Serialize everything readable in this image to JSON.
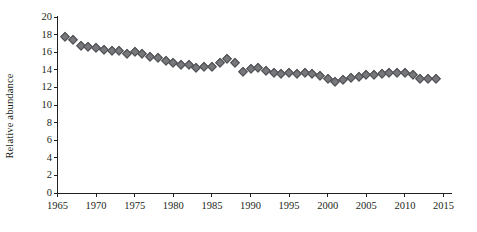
{
  "chart_data": {
    "type": "scatter",
    "title": "",
    "xlabel": "",
    "ylabel": "Relative abundance",
    "xlim": [
      1964,
      2016
    ],
    "ylim": [
      0,
      20
    ],
    "grid": false,
    "legend": null,
    "marker_shape": "diamond",
    "marker_color": "#77787b",
    "marker_edge_color": "#4d4e52",
    "x_ticks": [
      1965,
      1970,
      1975,
      1980,
      1985,
      1990,
      1995,
      2000,
      2005,
      2010,
      2015
    ],
    "y_ticks": [
      0,
      2,
      4,
      6,
      8,
      10,
      12,
      14,
      16,
      18,
      20
    ],
    "x": [
      1966,
      1967,
      1968,
      1969,
      1970,
      1971,
      1972,
      1973,
      1974,
      1975,
      1976,
      1977,
      1978,
      1979,
      1980,
      1981,
      1982,
      1983,
      1984,
      1985,
      1986,
      1987,
      1988,
      1989,
      1990,
      1991,
      1992,
      1993,
      1994,
      1995,
      1996,
      1997,
      1998,
      1999,
      2000,
      2001,
      2002,
      2003,
      2004,
      2005,
      2006,
      2007,
      2008,
      2009,
      2010,
      2011,
      2012,
      2013,
      2014
    ],
    "values": [
      17.7,
      17.4,
      16.7,
      16.6,
      16.5,
      16.2,
      16.1,
      16.1,
      15.8,
      16.0,
      15.8,
      15.4,
      15.3,
      15.0,
      14.8,
      14.5,
      14.5,
      14.2,
      14.3,
      14.3,
      14.8,
      15.2,
      14.8,
      13.7,
      14.1,
      14.2,
      13.9,
      13.6,
      13.5,
      13.6,
      13.5,
      13.6,
      13.5,
      13.3,
      13.0,
      12.6,
      12.8,
      13.1,
      13.2,
      13.4,
      13.4,
      13.5,
      13.6,
      13.6,
      13.6,
      13.4,
      12.9,
      13.0,
      13.0
    ],
    "colors": {
      "axis": "#231f20",
      "marker_fill": "#77787b",
      "marker_edge": "#4d4e52",
      "background": "#ffffff",
      "text": "#231f20"
    }
  }
}
